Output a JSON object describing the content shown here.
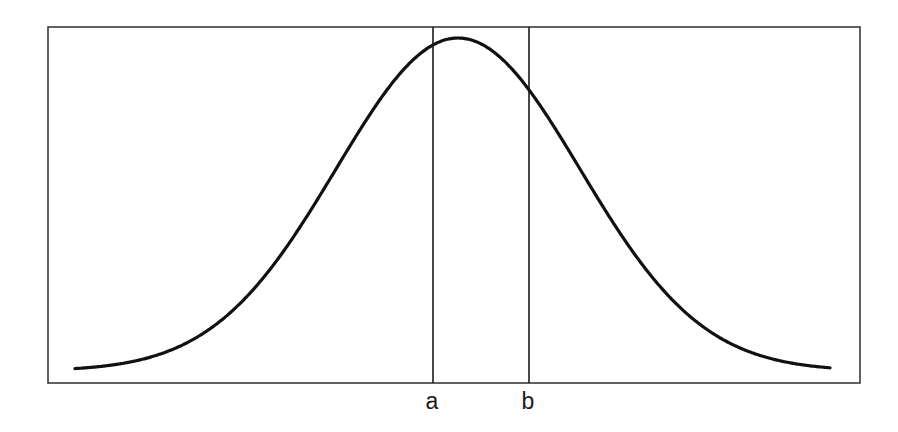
{
  "figure": {
    "title": "",
    "background_color": "#ffffff",
    "frame": {
      "name": "plot-frame",
      "x": 48,
      "y": 27,
      "width": 812,
      "height": 356,
      "stroke_color": "#3a3a3a",
      "stroke_width": 1.6
    },
    "curve": {
      "name": "normal-distribution-curve",
      "stroke_color": "#111111",
      "stroke_width": 3.2
    },
    "markers": [
      {
        "id": "a",
        "label": "a",
        "x": 433,
        "label_x": 432,
        "label_y": 409,
        "stroke_color": "#1a1a1a",
        "stroke_width": 1.6
      },
      {
        "id": "b",
        "label": "b",
        "x": 529,
        "label_x": 528,
        "label_y": 409,
        "stroke_color": "#1a1a1a",
        "stroke_width": 1.6
      }
    ]
  },
  "chart_data": {
    "type": "line",
    "title": "",
    "subtitle": "",
    "xlabel": "",
    "ylabel": "",
    "grid": false,
    "legend": null,
    "annotations": [
      {
        "text": "a",
        "x": 433,
        "type": "vertical-line-label"
      },
      {
        "text": "b",
        "x": 529,
        "type": "vertical-line-label"
      }
    ],
    "xlim": [
      48,
      860
    ],
    "ylim": [
      27,
      383
    ],
    "series": [
      {
        "name": "normal density",
        "distribution": "normal",
        "mean_px": 458,
        "sigma_px": 122,
        "peak_px": {
          "x": 458,
          "y": 38
        },
        "baseline_px": 371,
        "x": [
          75,
          110,
          145,
          180,
          215,
          250,
          285,
          300,
          320,
          340,
          360,
          380,
          400,
          420,
          433,
          440,
          458,
          470,
          490,
          510,
          529,
          545,
          565,
          580,
          600,
          620,
          640,
          660,
          680,
          700,
          735,
          770,
          800,
          830
        ],
        "y": [
          370.3,
          369.6,
          368.1,
          365.0,
          359.3,
          349.7,
          334.8,
          326.5,
          313.8,
          299.1,
          282.4,
          264.1,
          244.6,
          224.6,
          211.1,
          204.9,
          189.2,
          180.9,
          170.0,
          165.2,
          167.6,
          175.2,
          192.3,
          205.0,
          228.0,
          251.9,
          275.3,
          297.3,
          317.0,
          334.0,
          354.5,
          365.3,
          369.3,
          370.6
        ]
      }
    ]
  }
}
